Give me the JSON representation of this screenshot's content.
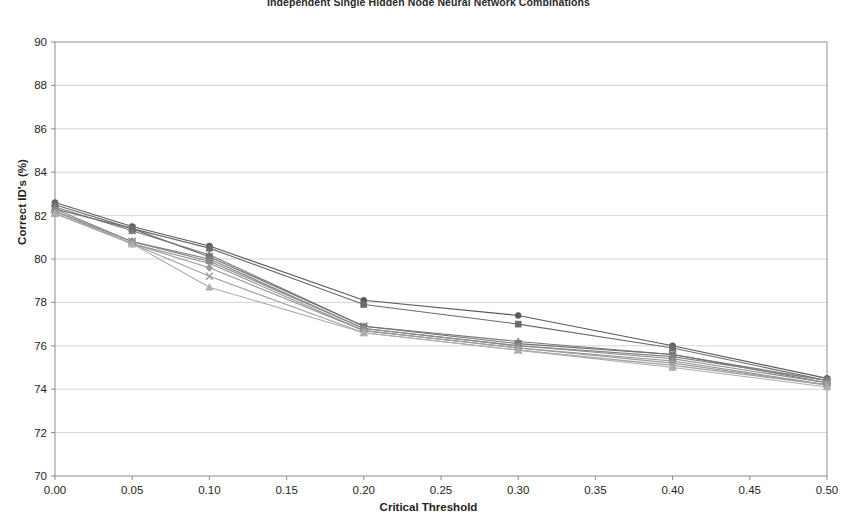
{
  "chart_data": {
    "type": "line",
    "title": "Independent Single Hidden Node Neural Network Combinations",
    "xlabel": "Critical Threshold",
    "ylabel": "Correct ID's (%)",
    "xlim": [
      0.0,
      0.5
    ],
    "ylim": [
      70,
      90
    ],
    "grid": "horizontal",
    "legend": "none",
    "x": [
      0.0,
      0.05,
      0.1,
      0.2,
      0.3,
      0.4,
      0.5
    ],
    "xticks": [
      "0.00",
      "0.05",
      "0.10",
      "0.15",
      "0.20",
      "0.25",
      "0.30",
      "0.35",
      "0.40",
      "0.45",
      "0.50"
    ],
    "xtick_values": [
      0.0,
      0.05,
      0.1,
      0.15,
      0.2,
      0.25,
      0.3,
      0.35,
      0.4,
      0.45,
      0.5
    ],
    "yticks": [
      "70",
      "72",
      "74",
      "76",
      "78",
      "80",
      "82",
      "84",
      "86",
      "88",
      "90"
    ],
    "ytick_values": [
      70,
      72,
      74,
      76,
      78,
      80,
      82,
      84,
      86,
      88,
      90
    ],
    "series": [
      {
        "name": "Series 1",
        "marker": "circle",
        "color": "#5a5a5a",
        "values": [
          82.6,
          81.5,
          80.6,
          78.1,
          77.4,
          76.0,
          74.5
        ]
      },
      {
        "name": "Series 2",
        "marker": "square",
        "color": "#6b6b6b",
        "values": [
          82.5,
          81.4,
          80.5,
          77.9,
          77.0,
          75.9,
          74.4
        ]
      },
      {
        "name": "Series 3",
        "marker": "triangle",
        "color": "#7a7a7a",
        "values": [
          82.4,
          81.3,
          80.2,
          76.9,
          76.2,
          75.6,
          74.4
        ]
      },
      {
        "name": "Series 4",
        "marker": "cross",
        "color": "#6f6f6f",
        "values": [
          82.3,
          81.4,
          80.1,
          76.9,
          76.1,
          75.6,
          74.3
        ]
      },
      {
        "name": "Series 5",
        "marker": "star",
        "color": "#808080",
        "values": [
          82.3,
          80.8,
          80.0,
          76.8,
          76.0,
          75.5,
          74.4
        ]
      },
      {
        "name": "Series 6",
        "marker": "circle",
        "color": "#888888",
        "values": [
          82.2,
          80.8,
          79.9,
          76.8,
          76.0,
          75.4,
          74.3
        ]
      },
      {
        "name": "Series 7",
        "marker": "plus",
        "color": "#909090",
        "values": [
          82.2,
          80.7,
          79.8,
          76.7,
          75.9,
          75.3,
          74.2
        ]
      },
      {
        "name": "Series 8",
        "marker": "diamond",
        "color": "#999999",
        "values": [
          82.1,
          80.7,
          79.6,
          76.7,
          75.9,
          75.2,
          74.2
        ]
      },
      {
        "name": "Series 9",
        "marker": "cross",
        "color": "#a0a0a0",
        "values": [
          82.1,
          80.7,
          79.2,
          76.6,
          75.8,
          75.1,
          74.2
        ]
      },
      {
        "name": "Series 10",
        "marker": "triangle",
        "color": "#adadad",
        "values": [
          82.1,
          80.7,
          78.7,
          76.6,
          75.8,
          75.0,
          74.1
        ]
      }
    ]
  },
  "geometry": {
    "plot_left": 55,
    "plot_right": 827,
    "plot_top": 42,
    "plot_bottom": 476
  }
}
